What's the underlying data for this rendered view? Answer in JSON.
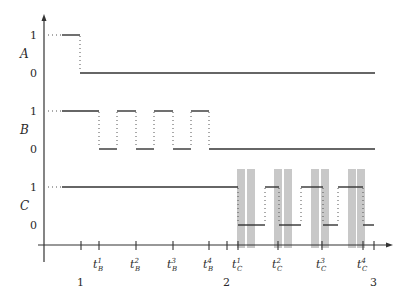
{
  "diagram": {
    "signals": [
      {
        "name": "A",
        "level_high": "1",
        "level_low": "0"
      },
      {
        "name": "B",
        "level_high": "1",
        "level_low": "0"
      },
      {
        "name": "C",
        "level_high": "1",
        "level_low": "0"
      }
    ],
    "x_axis": {
      "major_labels": [
        "1",
        "2",
        "3"
      ],
      "tick_labels": [
        {
          "base": "t",
          "sup": "1",
          "sub": "B"
        },
        {
          "base": "t",
          "sup": "2",
          "sub": "B"
        },
        {
          "base": "t",
          "sup": "3",
          "sub": "B"
        },
        {
          "base": "t",
          "sup": "4",
          "sub": "B"
        },
        {
          "base": "t",
          "sup": "1",
          "sub": "C"
        },
        {
          "base": "t",
          "sup": "2",
          "sub": "C"
        },
        {
          "base": "t",
          "sup": "3",
          "sub": "C"
        },
        {
          "base": "t",
          "sup": "4",
          "sub": "C"
        }
      ]
    },
    "colors": {
      "line": "#333333",
      "shaded_interval": "#c8c8c8"
    }
  }
}
